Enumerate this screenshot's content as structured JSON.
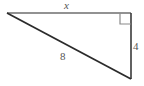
{
  "figure": {
    "type": "right-triangle-diagram",
    "background_color": "#ffffff",
    "stroke_color_light": "#6e6e6e",
    "stroke_color_dark": "#333333",
    "label_color": "#555555"
  },
  "labels": {
    "top_leg": "x",
    "vertical_leg": "4",
    "hypotenuse": "8"
  },
  "geometry": {
    "vertices": {
      "left": [
        7,
        13
      ],
      "top_right": [
        131,
        13
      ],
      "bottom_right": [
        131,
        79
      ]
    },
    "right_angle_marker": {
      "corner": "top-right",
      "size": 11
    }
  }
}
